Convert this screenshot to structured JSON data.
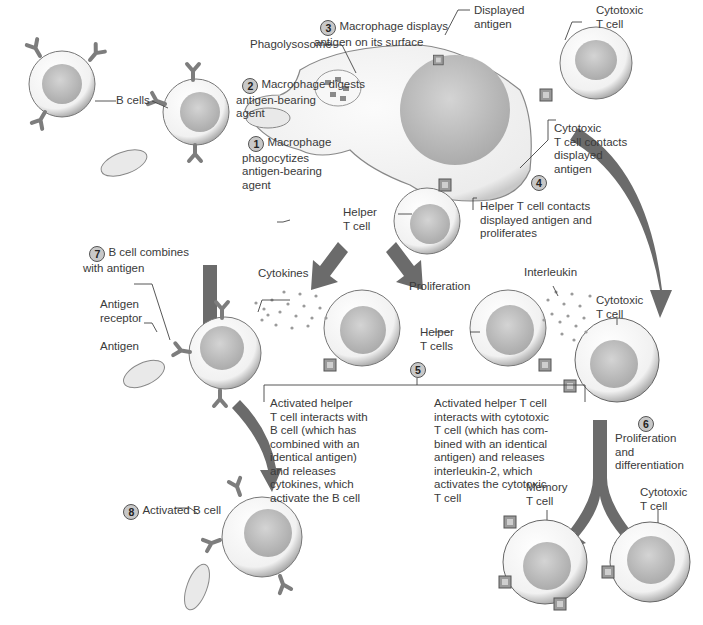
{
  "colors": {
    "arrow": "#6b6b6b",
    "cell_fill": "#f4f4f4",
    "cell_edge": "#8a8a8a",
    "nucleus": "#bdbdbd",
    "text": "#3a3a3a",
    "step_badge": "#c8c8c8"
  },
  "steps": [
    {
      "n": "1",
      "text": "Macrophage\nphagocytizes\nantigen-bearing\nagent"
    },
    {
      "n": "2",
      "text": "Macrophage digests\nantigen-bearing\nagent"
    },
    {
      "n": "3",
      "text": "Macrophage displays\nantigen on its surface"
    },
    {
      "n": "4",
      "text_a": "Cytotoxic\nT cell contacts\ndisplayed\nantigen",
      "text_b": "Helper T cell contacts\ndisplayed antigen and\nproliferates"
    },
    {
      "n": "5",
      "text_a": "Activated helper\nT cell interacts with\nB cell (which has\ncombined with an\nidentical antigen)\nand releases\ncytokines, which\nactivate the B cell",
      "text_b": "Activated helper T cell\ninteracts with cytotoxic\nT cell (which has com-\nbined with an identical\nantigen) and releases\ninterleukin-2, which\nactivates the cytotoxic\nT cell"
    },
    {
      "n": "6",
      "text": "Proliferation\nand\ndifferentiation"
    },
    {
      "n": "7",
      "text": "B cell combines\nwith antigen"
    },
    {
      "n": "8",
      "text": "Activated B cell"
    }
  ],
  "labels": {
    "phagolysosome": "Phagolysosome",
    "displayed_antigen": "Displayed\nantigen",
    "cytotoxic_t_top": "Cytotoxic\nT cell",
    "b_cells": "B cells",
    "helper_t_cell": "Helper\nT cell",
    "cytokines": "Cytokines",
    "proliferation": "Proliferation",
    "interleukin": "Interleukin",
    "helper_t_cells": "Helper\nT cells",
    "cytotoxic_t_mid": "Cytotoxic\nT cell",
    "antigen_receptor": "Antigen\nreceptor",
    "antigen": "Antigen",
    "memory_t_cell": "Memory\nT cell",
    "cytotoxic_t_bottom": "Cytotoxic\nT cell"
  }
}
